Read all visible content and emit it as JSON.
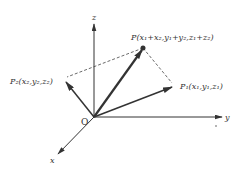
{
  "diagram": {
    "type": "3d-vector-addition",
    "colors": {
      "line": "#333333",
      "dashed": "#444444",
      "background": "#ffffff"
    },
    "origin": {
      "label": "O"
    },
    "axes": {
      "x": {
        "label": "x"
      },
      "y": {
        "label": "y"
      },
      "z": {
        "label": "z"
      }
    },
    "points": {
      "P": {
        "label": "P(x₁+x₂,y₁+y₂,z₁+z₂)"
      },
      "P1": {
        "label": "P₁(x₁,y₁,z₁)"
      },
      "P2": {
        "label": "P₂(x₂,y₂,z₂)"
      }
    }
  }
}
